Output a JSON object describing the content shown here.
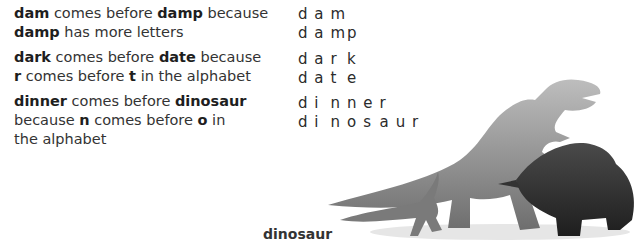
{
  "examples": [
    {
      "id": "dam-damp",
      "line1": [
        {
          "t": "dam",
          "b": true
        },
        {
          "t": " comes before ",
          "b": false
        },
        {
          "t": "damp",
          "b": true
        },
        {
          "t": " because",
          "b": false
        }
      ],
      "line2": [
        {
          "t": "damp",
          "b": true
        },
        {
          "t": " has more letters",
          "b": false
        }
      ],
      "words": [
        [
          "d",
          "a",
          "m"
        ],
        [
          "d",
          "a",
          "m",
          "p"
        ]
      ]
    },
    {
      "id": "dark-date",
      "line1": [
        {
          "t": "dark",
          "b": true
        },
        {
          "t": " comes before ",
          "b": false
        },
        {
          "t": "date",
          "b": true
        },
        {
          "t": " because",
          "b": false
        }
      ],
      "line2": [
        {
          "t": "r",
          "b": true
        },
        {
          "t": " comes before ",
          "b": false
        },
        {
          "t": "t",
          "b": true
        },
        {
          "t": " in the alphabet",
          "b": false
        }
      ],
      "words": [
        [
          "d",
          "a",
          "r",
          "k"
        ],
        [
          "d",
          "a",
          "t",
          "e"
        ]
      ]
    },
    {
      "id": "dinner-dinosaur",
      "line1": [
        {
          "t": "dinner",
          "b": true
        },
        {
          "t": " comes before ",
          "b": false
        },
        {
          "t": "dinosaur",
          "b": true
        }
      ],
      "line2": [
        {
          "t": "because ",
          "b": false
        },
        {
          "t": "n",
          "b": true
        },
        {
          "t": " comes before ",
          "b": false
        },
        {
          "t": "o",
          "b": true
        },
        {
          "t": " in",
          "b": false
        }
      ],
      "line3": [
        {
          "t": "the alphabet",
          "b": false
        }
      ],
      "words": [
        [
          "d",
          "i",
          "n",
          "n",
          "e",
          "r"
        ],
        [
          "d",
          "i",
          "n",
          "o",
          "s",
          "a",
          "u",
          "r"
        ]
      ]
    }
  ],
  "illustration": {
    "subject": "dinosaurs illustration",
    "caption": "dinosaur"
  }
}
